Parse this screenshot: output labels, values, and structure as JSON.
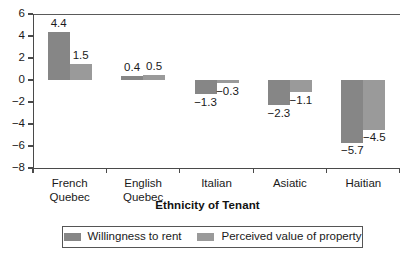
{
  "chart_data": {
    "type": "bar",
    "title": "",
    "xlabel": "Ethnicity of Tenant",
    "ylabel": "",
    "categories": [
      "French\nQuebec",
      "English\nQuebec",
      "Italian",
      "Asiatic",
      "Haitian"
    ],
    "category_lines": [
      [
        "French",
        "Quebec"
      ],
      [
        "English",
        "Quebec"
      ],
      [
        "Italian",
        ""
      ],
      [
        "Asiatic",
        ""
      ],
      [
        "Haitian",
        ""
      ]
    ],
    "series": [
      {
        "name": "Willingness to rent",
        "color": "#868686",
        "values": [
          4.4,
          0.4,
          -1.3,
          -2.3,
          -5.7
        ],
        "labels": [
          "4.4",
          "0.4",
          "−1.3",
          "−2.3",
          "−5.7"
        ]
      },
      {
        "name": "Perceived value of property",
        "color": "#9a9a9a",
        "values": [
          1.5,
          0.5,
          -0.3,
          -1.1,
          -4.5
        ],
        "labels": [
          "1.5",
          "0.5",
          "−0.3",
          "−1.1",
          "−4.5"
        ]
      }
    ],
    "ylim": [
      -8,
      6
    ],
    "yticks": [
      6,
      4,
      2,
      0,
      -2,
      -4,
      -6,
      -8
    ],
    "ytick_labels": [
      "6",
      "4",
      "2",
      "0",
      "−2",
      "−4",
      "−6",
      "−8"
    ],
    "grid": false,
    "legend_position": "bottom",
    "axis_color": "#4a4a4a"
  }
}
